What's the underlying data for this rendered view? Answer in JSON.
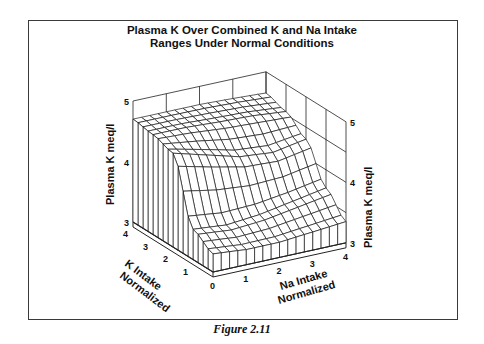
{
  "figure": {
    "caption": "Figure 2.11"
  },
  "chart_data": {
    "type": "surface3d",
    "title": "Plasma K Over Combined K and Na Intake Ranges Under Normal Conditions",
    "title_lines": [
      "Plasma K Over Combined K and Na Intake",
      "Ranges Under Normal Conditions"
    ],
    "x_axis": {
      "label_lines": [
        "Na Intake",
        "Normalized"
      ],
      "range": [
        0,
        4
      ],
      "ticks": [
        0,
        1,
        2,
        3,
        4
      ]
    },
    "y_axis": {
      "label_lines": [
        "K Intake",
        "Normalized"
      ],
      "range": [
        0,
        4
      ],
      "ticks": [
        1,
        2,
        3,
        4
      ]
    },
    "z_axis": {
      "label": "Plasma K  meq/l",
      "range": [
        3,
        5
      ],
      "ticks": [
        3,
        4,
        5
      ]
    },
    "grid_divisions": 16,
    "surface_description": "Plateau near 4.7 meq/l at high K intake; falls toward ~3.25 meq/l as K intake approaches 0. Drop is steeper at low Na intake and more gradual at high Na intake.",
    "sample_values": {
      "k_intake": [
        0,
        1,
        2,
        3,
        4
      ],
      "na_intake": [
        0,
        1,
        2,
        3,
        4
      ],
      "plasma_k_rows_by_k": [
        [
          3.3,
          3.25,
          3.25,
          3.3,
          3.35
        ],
        [
          3.5,
          3.45,
          3.5,
          3.6,
          3.7
        ],
        [
          4.55,
          4.4,
          4.25,
          4.2,
          4.3
        ],
        [
          4.65,
          4.65,
          4.62,
          4.6,
          4.55
        ],
        [
          4.7,
          4.7,
          4.7,
          4.68,
          4.65
        ]
      ]
    },
    "grid": false,
    "legend": null
  }
}
